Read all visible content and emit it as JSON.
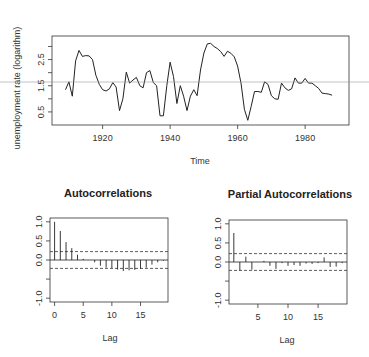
{
  "chart_data": [
    {
      "type": "line",
      "title": "",
      "xlabel": "Time",
      "ylabel": "unemployment rate (logarithm)",
      "xlim": [
        1905,
        1993
      ],
      "ylim": [
        0.0,
        3.4
      ],
      "x_ticks": [
        "1920",
        "1940",
        "1960",
        "1980"
      ],
      "y_ticks": [
        "0.5",
        "1.5",
        "2.5"
      ],
      "grid": false,
      "x": [
        1909,
        1910,
        1911,
        1912,
        1913,
        1914,
        1915,
        1916,
        1917,
        1918,
        1919,
        1920,
        1921,
        1922,
        1923,
        1924,
        1925,
        1926,
        1927,
        1928,
        1929,
        1930,
        1931,
        1932,
        1933,
        1934,
        1935,
        1936,
        1937,
        1938,
        1939,
        1940,
        1941,
        1942,
        1943,
        1944,
        1945,
        1946,
        1947,
        1948,
        1949,
        1950,
        1951,
        1952,
        1953,
        1954,
        1955,
        1956,
        1957,
        1958,
        1959,
        1960,
        1961,
        1962,
        1963,
        1964,
        1965,
        1966,
        1967,
        1968,
        1969,
        1970,
        1971,
        1972,
        1973,
        1974,
        1975,
        1976,
        1977,
        1978,
        1979,
        1980,
        1981,
        1982,
        1983,
        1984,
        1985,
        1986,
        1987,
        1988
      ],
      "values": [
        1.35,
        1.65,
        1.1,
        2.45,
        2.85,
        2.62,
        2.65,
        2.64,
        2.5,
        1.9,
        1.55,
        1.35,
        1.3,
        1.38,
        1.62,
        1.45,
        0.55,
        1.0,
        2.02,
        1.6,
        1.72,
        1.82,
        1.5,
        1.42,
        2.0,
        2.08,
        1.62,
        1.5,
        0.35,
        0.35,
        1.5,
        2.4,
        1.85,
        0.82,
        1.5,
        1.1,
        0.55,
        1.1,
        1.35,
        1.12,
        2.1,
        2.75,
        3.1,
        3.12,
        3.0,
        2.92,
        2.8,
        2.62,
        2.82,
        2.74,
        2.6,
        2.25,
        1.6,
        0.6,
        0.18,
        0.7,
        1.28,
        1.28,
        1.25,
        1.65,
        1.55,
        1.12,
        1.0,
        0.98,
        1.6,
        1.42,
        1.32,
        1.38,
        1.8,
        1.6,
        1.6,
        1.78,
        1.6,
        1.6,
        1.5,
        1.4,
        1.22,
        1.2,
        1.18,
        1.14
      ]
    },
    {
      "type": "bar",
      "title": "Autocorrelations",
      "xlabel": "Lag",
      "ylabel": "",
      "xlim": [
        -0.8,
        19.8
      ],
      "ylim": [
        -1.1,
        1.1
      ],
      "x_ticks": [
        "0",
        "5",
        "10",
        "15"
      ],
      "y_ticks": [
        "-1.0",
        "0.0",
        "0.5",
        "1.0"
      ],
      "confidence_band": 0.22,
      "lags": [
        0,
        1,
        2,
        3,
        4,
        5,
        6,
        7,
        8,
        9,
        10,
        11,
        12,
        13,
        14,
        15,
        16,
        17,
        18,
        19
      ],
      "values": [
        1.0,
        0.76,
        0.47,
        0.31,
        0.14,
        0.03,
        0.0,
        -0.06,
        -0.15,
        -0.2,
        -0.21,
        -0.25,
        -0.29,
        -0.27,
        -0.26,
        -0.23,
        -0.2,
        -0.12,
        -0.06,
        -0.02
      ]
    },
    {
      "type": "bar",
      "title": "Partial Autocorrelations",
      "xlabel": "Lag",
      "ylabel": "",
      "xlim": [
        0.2,
        19.8
      ],
      "ylim": [
        -1.1,
        1.1
      ],
      "x_ticks": [
        "5",
        "10",
        "15"
      ],
      "y_ticks": [
        "-1.0",
        "0.0",
        "0.5",
        "1.0"
      ],
      "confidence_band": 0.22,
      "lags": [
        1,
        2,
        3,
        4,
        5,
        6,
        7,
        8,
        9,
        10,
        11,
        12,
        13,
        14,
        15,
        16,
        17,
        18,
        19
      ],
      "values": [
        0.76,
        -0.22,
        0.14,
        -0.2,
        0.0,
        0.03,
        -0.1,
        -0.18,
        -0.03,
        -0.1,
        -0.08,
        -0.1,
        -0.04,
        -0.05,
        -0.03,
        0.12,
        -0.13,
        -0.12,
        -0.03
      ]
    }
  ],
  "labels": {
    "ts_ylabel": "unemployment rate (logarithm)",
    "ts_xlabel": "Time",
    "acf_title": "Autocorrelations",
    "acf_xlabel": "Lag",
    "pacf_title": "Partial Autocorrelations",
    "pacf_xlabel": "Lag"
  }
}
